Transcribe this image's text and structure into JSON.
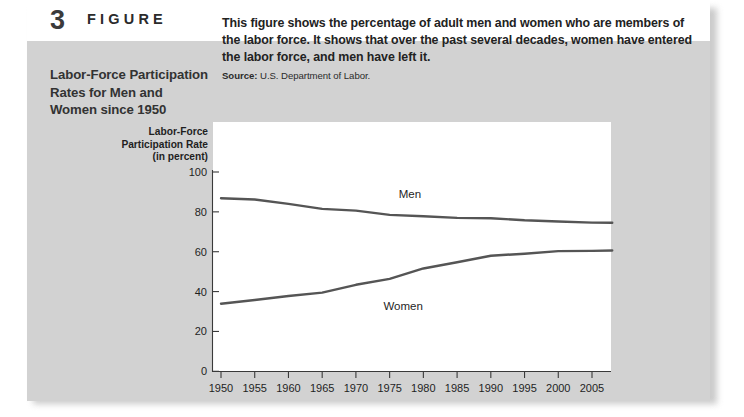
{
  "figure": {
    "number": "3",
    "word": "FIGURE",
    "title": "Labor-Force Participation Rates for Men and Women since 1950",
    "description": "This figure shows the percentage of adult men and women who are members of the labor force. It shows that over the past several decades, women have entered the labor force, and men have left it.",
    "source_label": "Source:",
    "source_text": "U.S. Department of Labor."
  },
  "chart_data": {
    "type": "line",
    "title": "Labor-Force Participation Rates for Men and Women since 1950",
    "xlabel": "",
    "ylabel": "Labor-Force Participation Rate (in percent)",
    "xlim": [
      1950,
      2008
    ],
    "ylim": [
      0,
      100
    ],
    "xticks": [
      1950,
      1955,
      1960,
      1965,
      1970,
      1975,
      1980,
      1985,
      1990,
      1995,
      2000,
      2005
    ],
    "yticks": [
      0,
      20,
      40,
      60,
      80,
      100
    ],
    "grid": false,
    "legend_position": "inline-labels",
    "line_color": "#555555",
    "x": [
      1950,
      1955,
      1960,
      1965,
      1970,
      1975,
      1980,
      1985,
      1990,
      1995,
      2000,
      2005,
      2008
    ],
    "series": [
      {
        "name": "Men",
        "label": "Men",
        "label_x": 1978,
        "label_y": 87,
        "values": [
          86.8,
          86.2,
          84.0,
          81.5,
          80.6,
          78.5,
          77.8,
          77.0,
          76.8,
          75.8,
          75.2,
          74.6,
          74.5
        ]
      },
      {
        "name": "Women",
        "label": "Women",
        "label_x": 1977,
        "label_y": 31,
        "values": [
          33.9,
          35.8,
          37.8,
          39.5,
          43.4,
          46.4,
          51.6,
          54.7,
          58.0,
          59.0,
          60.3,
          60.4,
          60.6
        ]
      }
    ]
  }
}
